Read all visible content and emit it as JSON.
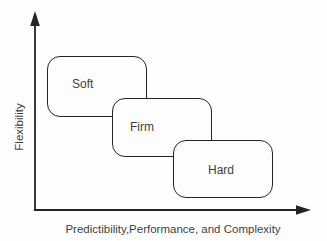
{
  "diagram": {
    "y_axis": {
      "label": "Flexibility"
    },
    "x_axis": {
      "label": "Predictibility,Performance, and Complexity"
    },
    "nodes": [
      {
        "label": "Soft"
      },
      {
        "label": "Firm"
      },
      {
        "label": "Hard"
      }
    ],
    "colors": {
      "line": "#242424",
      "text": "#3f3f3f",
      "node_fill": "#fdfdfd",
      "background": "#fefefe"
    }
  }
}
